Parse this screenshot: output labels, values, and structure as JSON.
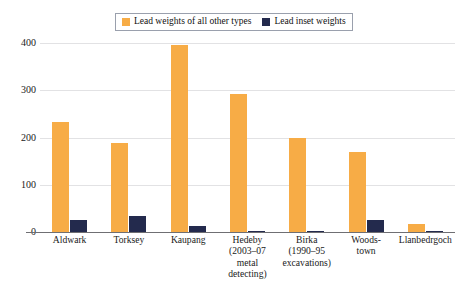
{
  "chart_data": {
    "type": "bar",
    "title": "",
    "subtitle": "",
    "xlabel": "",
    "ylabel": "",
    "ylim": [
      0,
      420
    ],
    "yticks": [
      0,
      100,
      200,
      300,
      400
    ],
    "ytick_labels": [
      "0",
      "100",
      "200",
      "300",
      "400"
    ],
    "grid": true,
    "grid_axis": "y",
    "legend_position": "top-center",
    "categories": [
      "Aldwark",
      "Torksey",
      "Kaupang",
      "Hedeby (2003–07 metal detecting)",
      "Birka (1990–95 excavations)",
      "Woodstown",
      "Llanbedrgoch"
    ],
    "category_lines": [
      [
        "Aldwark"
      ],
      [
        "Torksey"
      ],
      [
        "Kaupang"
      ],
      [
        "Hedeby",
        "(2003–07",
        "metal",
        "detecting)"
      ],
      [
        "Birka",
        "(1990–95",
        "excavations)"
      ],
      [
        "Woods-",
        "town"
      ],
      [
        "Llanbedrgoch"
      ]
    ],
    "series": [
      {
        "name": "Lead weights of all other types",
        "color": "#F7AC46",
        "values": [
          233,
          188,
          395,
          293,
          200,
          170,
          18
        ]
      },
      {
        "name": "Lead inset weights",
        "color": "#232A4D",
        "values": [
          25,
          33,
          13,
          3,
          1,
          25,
          2
        ]
      }
    ]
  },
  "legend": {
    "items": [
      {
        "label": "Lead weights of all other types",
        "color": "#F7AC46"
      },
      {
        "label": "Lead inset weights",
        "color": "#232A4D"
      }
    ]
  },
  "colors": {
    "primary": "#F7AC46",
    "secondary": "#232A4D",
    "gridline": "#e2e2e4",
    "axis": "#6f6f73",
    "background": "#ffffff",
    "text": "#1a1a1a",
    "legend_border": "#9aa0ad"
  }
}
